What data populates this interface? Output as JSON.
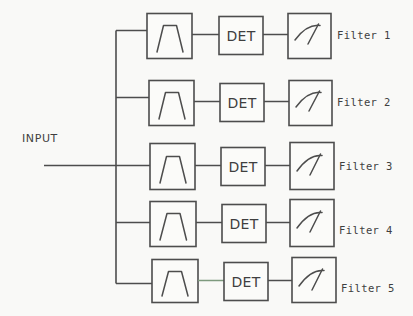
{
  "diagram": {
    "input_label": "INPUT",
    "line_color": "#4d4d4d",
    "background_color": "#f9f9f7",
    "tinted_line_color": "#7e9a7e",
    "block_labels": {
      "filter_block": "bandpass-filter-response",
      "detector_block": "DET",
      "meter_block": "analog-meter"
    },
    "channels": [
      {
        "index": 1,
        "label": "Filter 1",
        "detector": "DET"
      },
      {
        "index": 2,
        "label": "Filter 2",
        "detector": "DET"
      },
      {
        "index": 3,
        "label": "Filter 3",
        "detector": "DET"
      },
      {
        "index": 4,
        "label": "Filter 4",
        "detector": "DET"
      },
      {
        "index": 5,
        "label": "Filter 5",
        "detector": "DET"
      }
    ]
  }
}
